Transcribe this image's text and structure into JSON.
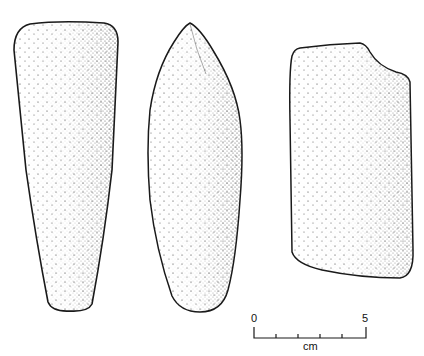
{
  "figure": {
    "artifacts": [
      {
        "id": "artifact-1",
        "label": "tapered stone tool, front view"
      },
      {
        "id": "artifact-2",
        "label": "pointed stone tool, side view"
      },
      {
        "id": "artifact-3",
        "label": "rectangular stone tool fragment"
      }
    ]
  },
  "scale_bar": {
    "start_label": "0",
    "end_label": "5",
    "unit_label": "cm",
    "divisions": 5
  },
  "colors": {
    "ink": "#1a1a1a",
    "background": "#ffffff"
  }
}
